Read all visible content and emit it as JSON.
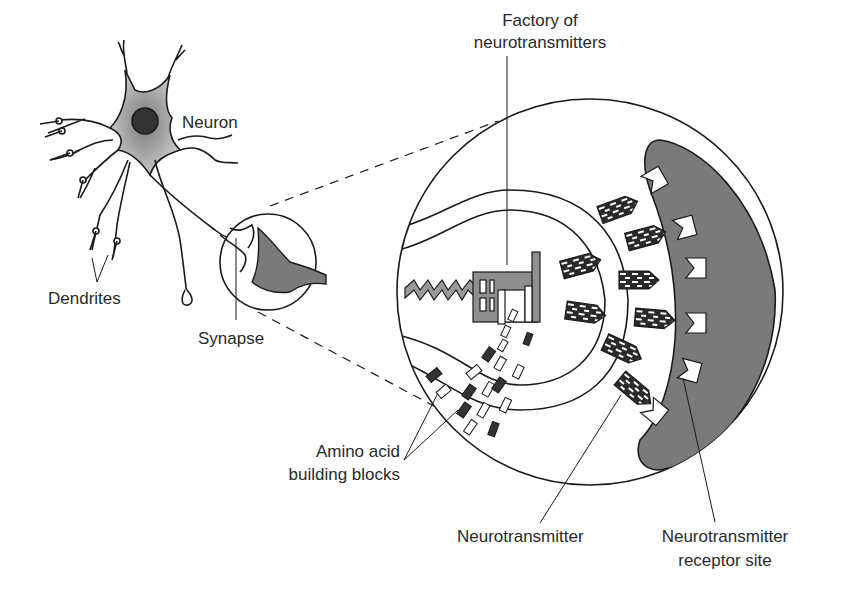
{
  "diagram": {
    "labels": {
      "neuron": "Neuron",
      "dendrites": "Dendrites",
      "synapse": "Synapse",
      "factory_line1": "Factory of",
      "factory_line2": "neurotransmitters",
      "amino_line1": "Amino acid",
      "amino_line2": "building blocks",
      "neurotransmitter": "Neurotransmitter",
      "receptor_line1": "Neurotransmitter",
      "receptor_line2": "receptor site"
    },
    "colors": {
      "line": "#1a1a1a",
      "cell_gray": "#7a7a7a",
      "soma_gray": "#a8a8a8",
      "nucleus": "#333333",
      "factory_gray": "#8f8f8f",
      "background": "#ffffff"
    }
  }
}
